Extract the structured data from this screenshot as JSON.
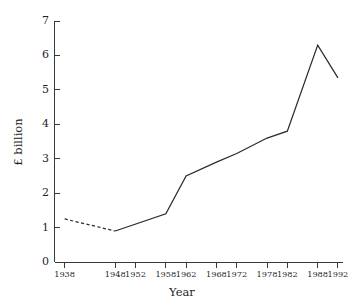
{
  "chart_data": {
    "type": "line",
    "title": "",
    "xlabel": "Year",
    "ylabel": "£ billion",
    "x": [
      1938,
      1948,
      1958,
      1962,
      1968,
      1972,
      1978,
      1982,
      1988,
      1992
    ],
    "values": [
      1.25,
      0.9,
      1.4,
      2.5,
      2.9,
      3.15,
      3.6,
      3.8,
      6.3,
      5.35
    ],
    "series": [
      {
        "name": "£ billion",
        "values": [
          1.25,
          0.9,
          1.4,
          2.5,
          2.9,
          3.15,
          3.6,
          3.8,
          6.3,
          5.35
        ]
      }
    ],
    "dashed_segment": {
      "from_x": 1938,
      "to_x": 1948,
      "note": "estimated / interpolated data shown as dotted line"
    },
    "xlim": [
      1936,
      1993
    ],
    "ylim": [
      0,
      7
    ],
    "ytick_labels": [
      "0",
      "1",
      "2",
      "3",
      "4",
      "5",
      "6",
      "7"
    ],
    "ytick_values": [
      0,
      1,
      2,
      3,
      4,
      5,
      6,
      7
    ],
    "xtick_labels": [
      "1938",
      "1948",
      "1952",
      "1958",
      "1962",
      "1968",
      "1972",
      "1978",
      "1982",
      "1988",
      "1992"
    ],
    "xtick_values": [
      1938,
      1948,
      1952,
      1958,
      1962,
      1968,
      1972,
      1978,
      1982,
      1988,
      1992
    ],
    "grid": false,
    "legend": "none",
    "line_color": "#2b2b2b",
    "axis_color": "#3a3a3a",
    "background": "#ffffff"
  },
  "axes": {
    "y_title": "£ billion",
    "x_title": "Year"
  }
}
